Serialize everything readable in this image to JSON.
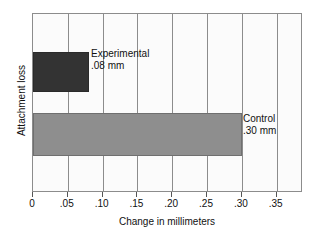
{
  "chart_data": {
    "type": "bar",
    "orientation": "horizontal",
    "title": "",
    "xlabel": "Change in millimeters",
    "ylabel": "Attachment loss",
    "xlim": [
      0,
      0.385
    ],
    "xticks": [
      "0",
      ".05",
      ".10",
      ".15",
      ".20",
      ".25",
      ".30",
      ".35"
    ],
    "xtick_values": [
      0,
      0.05,
      0.1,
      0.15,
      0.2,
      0.25,
      0.3,
      0.35
    ],
    "grid": "vertical",
    "legend": "none",
    "categories": [
      "Experimental",
      "Control"
    ],
    "values": [
      0.08,
      0.3
    ],
    "bars": [
      {
        "name": "Experimental",
        "value": 0.08,
        "label_name": "Experimental",
        "label_value": ".08 mm",
        "color": "#333333"
      },
      {
        "name": "Control",
        "value": 0.3,
        "label_name": "Control",
        "label_value": ".30 mm",
        "color": "#8e8e8e"
      }
    ]
  },
  "colors": {
    "background": "#ffffff",
    "plot_background": "#fbfbfb",
    "axis": "#8c8c8c",
    "text": "#111111",
    "bar_experimental": "#333333",
    "bar_control": "#8e8e8e"
  }
}
